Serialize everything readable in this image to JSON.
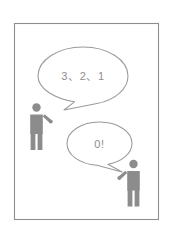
{
  "scene": {
    "title": "countdown-comic-panel",
    "background_color": "#ffffff",
    "frame": {
      "border_color": "#8e8e92",
      "fill_color": "#ffffff"
    }
  },
  "speech_bubbles": [
    {
      "id": "bubble-countdown",
      "text": "3、2、1",
      "speaker": "left-person",
      "tail_direction": "down-left",
      "outline_color": "#9a9a9a",
      "fill_color": "#ffffff",
      "text_color": "#8d8d8d"
    },
    {
      "id": "bubble-zero",
      "text": "0!",
      "speaker": "right-person",
      "tail_direction": "down-right",
      "outline_color": "#9a9a9a",
      "fill_color": "#ffffff",
      "text_color": "#8d8d8d"
    }
  ],
  "figures": [
    {
      "id": "left-person",
      "label": "person-silhouette-left",
      "arm": "right-arm-raised",
      "color": "#8c8c8c"
    },
    {
      "id": "right-person",
      "label": "person-silhouette-right",
      "arm": "left-arm-raised",
      "color": "#8c8c8c"
    }
  ]
}
